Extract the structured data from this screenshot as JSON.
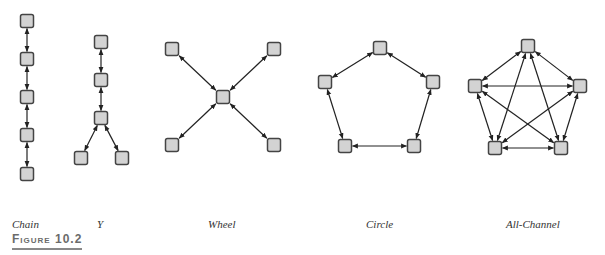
{
  "networks": [
    {
      "name": "Chain",
      "label_x": 12,
      "nodes": [
        [
          27,
          21
        ],
        [
          27,
          59
        ],
        [
          27,
          97
        ],
        [
          27,
          135
        ],
        [
          27,
          174
        ]
      ],
      "edges": [
        [
          0,
          1
        ],
        [
          1,
          2
        ],
        [
          2,
          3
        ],
        [
          3,
          4
        ]
      ]
    },
    {
      "name": "Y",
      "label_x": 97,
      "nodes": [
        [
          101,
          42
        ],
        [
          101,
          80
        ],
        [
          101,
          118
        ],
        [
          81,
          158
        ],
        [
          122,
          158
        ]
      ],
      "edges": [
        [
          0,
          1
        ],
        [
          1,
          2
        ],
        [
          2,
          3
        ],
        [
          2,
          4
        ]
      ]
    },
    {
      "name": "Wheel",
      "label_x": 208,
      "nodes": [
        [
          223,
          97
        ],
        [
          172,
          49
        ],
        [
          274,
          49
        ],
        [
          172,
          145
        ],
        [
          274,
          145
        ]
      ],
      "edges": [
        [
          0,
          1
        ],
        [
          0,
          2
        ],
        [
          0,
          3
        ],
        [
          0,
          4
        ]
      ]
    },
    {
      "name": "Circle",
      "label_x": 366,
      "nodes": [
        [
          380,
          48
        ],
        [
          325,
          82
        ],
        [
          433,
          82
        ],
        [
          345,
          146
        ],
        [
          414,
          146
        ]
      ],
      "edges": [
        [
          0,
          1
        ],
        [
          0,
          2
        ],
        [
          1,
          3
        ],
        [
          2,
          4
        ],
        [
          3,
          4
        ]
      ]
    },
    {
      "name": "All-Channel",
      "label_x": 506,
      "nodes": [
        [
          528,
          46
        ],
        [
          475,
          86
        ],
        [
          580,
          86
        ],
        [
          495,
          148
        ],
        [
          561,
          148
        ]
      ],
      "edges": [
        [
          0,
          1
        ],
        [
          0,
          2
        ],
        [
          0,
          3
        ],
        [
          0,
          4
        ],
        [
          1,
          2
        ],
        [
          1,
          3
        ],
        [
          1,
          4
        ],
        [
          2,
          3
        ],
        [
          2,
          4
        ],
        [
          3,
          4
        ]
      ]
    }
  ],
  "figure_label": "Figure 10.2",
  "style": {
    "node_fill": "#d3d3d3",
    "node_stroke": "#444444",
    "edge_color": "#222222",
    "node_size": 13
  }
}
